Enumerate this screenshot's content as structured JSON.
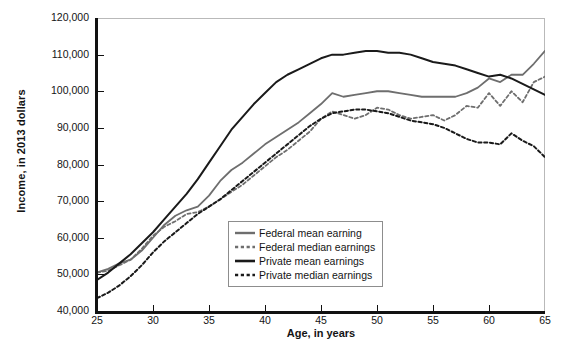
{
  "chart_data": {
    "type": "line",
    "title": "",
    "xlabel": "Age, in years",
    "ylabel": "Income, in 2013 dollars",
    "xlim": [
      25,
      65
    ],
    "ylim": [
      40000,
      120000
    ],
    "xticks": [
      25,
      30,
      35,
      40,
      45,
      50,
      55,
      60,
      65
    ],
    "yticks": [
      40000,
      50000,
      60000,
      70000,
      80000,
      90000,
      100000,
      110000,
      120000
    ],
    "ytick_labels": [
      "40,000",
      "50,000",
      "60,000",
      "70,000",
      "80,000",
      "90,000",
      "100,000",
      "110,000",
      "120,000"
    ],
    "xtick_labels": [
      "25",
      "30",
      "35",
      "40",
      "45",
      "50",
      "55",
      "60",
      "65"
    ],
    "grid": false,
    "legend_position": "lower-center",
    "x": [
      25,
      26,
      27,
      28,
      29,
      30,
      31,
      32,
      33,
      34,
      35,
      36,
      37,
      38,
      39,
      40,
      41,
      42,
      43,
      44,
      45,
      46,
      47,
      48,
      49,
      50,
      51,
      52,
      53,
      54,
      55,
      56,
      57,
      58,
      59,
      60,
      61,
      62,
      63,
      64,
      65
    ],
    "series": [
      {
        "name": "Federal mean earning",
        "color": "#6e6e6e",
        "style": "solid",
        "width": 1.8,
        "values": [
          50500,
          51500,
          53000,
          54000,
          56500,
          60000,
          63500,
          66000,
          67500,
          68500,
          71500,
          75500,
          78500,
          80500,
          83000,
          85500,
          87500,
          89500,
          91500,
          94000,
          96500,
          99500,
          98500,
          99000,
          99500,
          100000,
          100000,
          99500,
          99000,
          98500,
          98500,
          98500,
          98500,
          99500,
          101000,
          103500,
          102500,
          104500,
          104500,
          107500,
          111000
        ]
      },
      {
        "name": "Federal median earnings",
        "color": "#6e6e6e",
        "style": "dashed",
        "width": 1.8,
        "values": [
          50500,
          51000,
          52500,
          54000,
          57000,
          60500,
          63000,
          64500,
          66500,
          67000,
          68500,
          70500,
          72500,
          74500,
          77000,
          79500,
          82000,
          84000,
          86500,
          89000,
          92500,
          94500,
          93500,
          92500,
          93500,
          95500,
          95000,
          93500,
          92500,
          93000,
          93500,
          92000,
          93500,
          96000,
          95500,
          99500,
          96000,
          100000,
          97000,
          102500,
          104000
        ]
      },
      {
        "name": "Private mean earnings",
        "color": "#1a1a1a",
        "style": "solid",
        "width": 2.0,
        "values": [
          48500,
          50500,
          53000,
          55500,
          58500,
          61500,
          65000,
          68500,
          72000,
          76000,
          80500,
          85000,
          89500,
          93000,
          96500,
          99500,
          102500,
          104500,
          106000,
          107500,
          109000,
          110000,
          110000,
          110500,
          111000,
          111000,
          110500,
          110500,
          110000,
          109000,
          108000,
          107500,
          107000,
          106000,
          105000,
          104000,
          104500,
          103500,
          102000,
          100500,
          99000
        ]
      },
      {
        "name": "Private median earnings",
        "color": "#1a1a1a",
        "style": "dashed",
        "width": 2.0,
        "values": [
          43500,
          45000,
          47000,
          49500,
          52500,
          56000,
          59000,
          61500,
          64000,
          66500,
          68500,
          70500,
          73000,
          75500,
          78000,
          80500,
          83000,
          85500,
          88000,
          90500,
          92500,
          94000,
          94500,
          95000,
          95000,
          94500,
          94000,
          93000,
          92000,
          91500,
          91000,
          90000,
          88500,
          87000,
          86000,
          86000,
          85500,
          88500,
          86500,
          85000,
          82000
        ]
      }
    ]
  },
  "legend": {
    "items": [
      {
        "label": "Federal mean earning"
      },
      {
        "label": "Federal median earnings"
      },
      {
        "label": "Private mean earnings"
      },
      {
        "label": "Private median earnings"
      }
    ]
  }
}
